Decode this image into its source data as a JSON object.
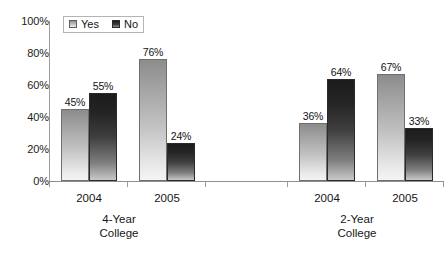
{
  "chart_data": {
    "type": "bar",
    "title": "",
    "subtitle": "",
    "xlabel": "",
    "ylabel": "",
    "ylim": [
      0,
      100
    ],
    "y_tick_labels": [
      "100%",
      "80%",
      "60%",
      "40%",
      "20%",
      "0%"
    ],
    "y_tick_values": [
      100,
      80,
      60,
      40,
      20,
      0
    ],
    "grid": false,
    "legend_position": "top-left-inside",
    "legend_entries": [
      "Yes",
      "No"
    ],
    "series": [
      {
        "name": "Yes",
        "values": [
          45,
          76,
          36,
          67
        ]
      },
      {
        "name": "No",
        "values": [
          55,
          24,
          64,
          33
        ]
      }
    ],
    "categories": [
      "2004",
      "2005",
      "2004",
      "2005"
    ],
    "groups": [
      {
        "label_line1": "4-Year",
        "label_line2": "College",
        "categories": [
          "2004",
          "2005"
        ],
        "yes": [
          45,
          76
        ],
        "no": [
          55,
          24
        ]
      },
      {
        "label_line1": "2-Year",
        "label_line2": "College",
        "categories": [
          "2004",
          "2005"
        ],
        "yes": [
          36,
          67
        ],
        "no": [
          64,
          33
        ]
      }
    ],
    "data_labels": [
      "45%",
      "55%",
      "76%",
      "24%",
      "36%",
      "64%",
      "67%",
      "33%"
    ],
    "colors": {
      "yes_top": "#8c8c8c",
      "yes_bottom": "#f4f4f4",
      "no_top": "#1c1c1c",
      "no_bottom": "#c8c8c8",
      "axis": "#9a9a9a",
      "text": "#1a1a1a",
      "background": "#ffffff"
    }
  },
  "axis": {
    "y_ticks": [
      {
        "label": "100%"
      },
      {
        "label": "80%"
      },
      {
        "label": "60%"
      },
      {
        "label": "40%"
      },
      {
        "label": "20%"
      },
      {
        "label": "0%"
      }
    ]
  },
  "legend": {
    "yes_label": "Yes",
    "no_label": "No"
  },
  "bars": [
    {
      "value_label": "45%",
      "series": "Yes",
      "category": "2004",
      "group": "4-Year College"
    },
    {
      "value_label": "55%",
      "series": "No",
      "category": "2004",
      "group": "4-Year College"
    },
    {
      "value_label": "76%",
      "series": "Yes",
      "category": "2005",
      "group": "4-Year College"
    },
    {
      "value_label": "24%",
      "series": "No",
      "category": "2005",
      "group": "4-Year College"
    },
    {
      "value_label": "36%",
      "series": "Yes",
      "category": "2004",
      "group": "2-Year College"
    },
    {
      "value_label": "64%",
      "series": "No",
      "category": "2004",
      "group": "2-Year College"
    },
    {
      "value_label": "67%",
      "series": "Yes",
      "category": "2005",
      "group": "2-Year College"
    },
    {
      "value_label": "33%",
      "series": "No",
      "category": "2005",
      "group": "2-Year College"
    }
  ],
  "category_labels": [
    {
      "text": "2004"
    },
    {
      "text": "2005"
    },
    {
      "text": "2004"
    },
    {
      "text": "2005"
    }
  ],
  "group_labels": [
    {
      "line1": "4-Year",
      "line2": "College"
    },
    {
      "line1": "2-Year",
      "line2": "College"
    }
  ]
}
